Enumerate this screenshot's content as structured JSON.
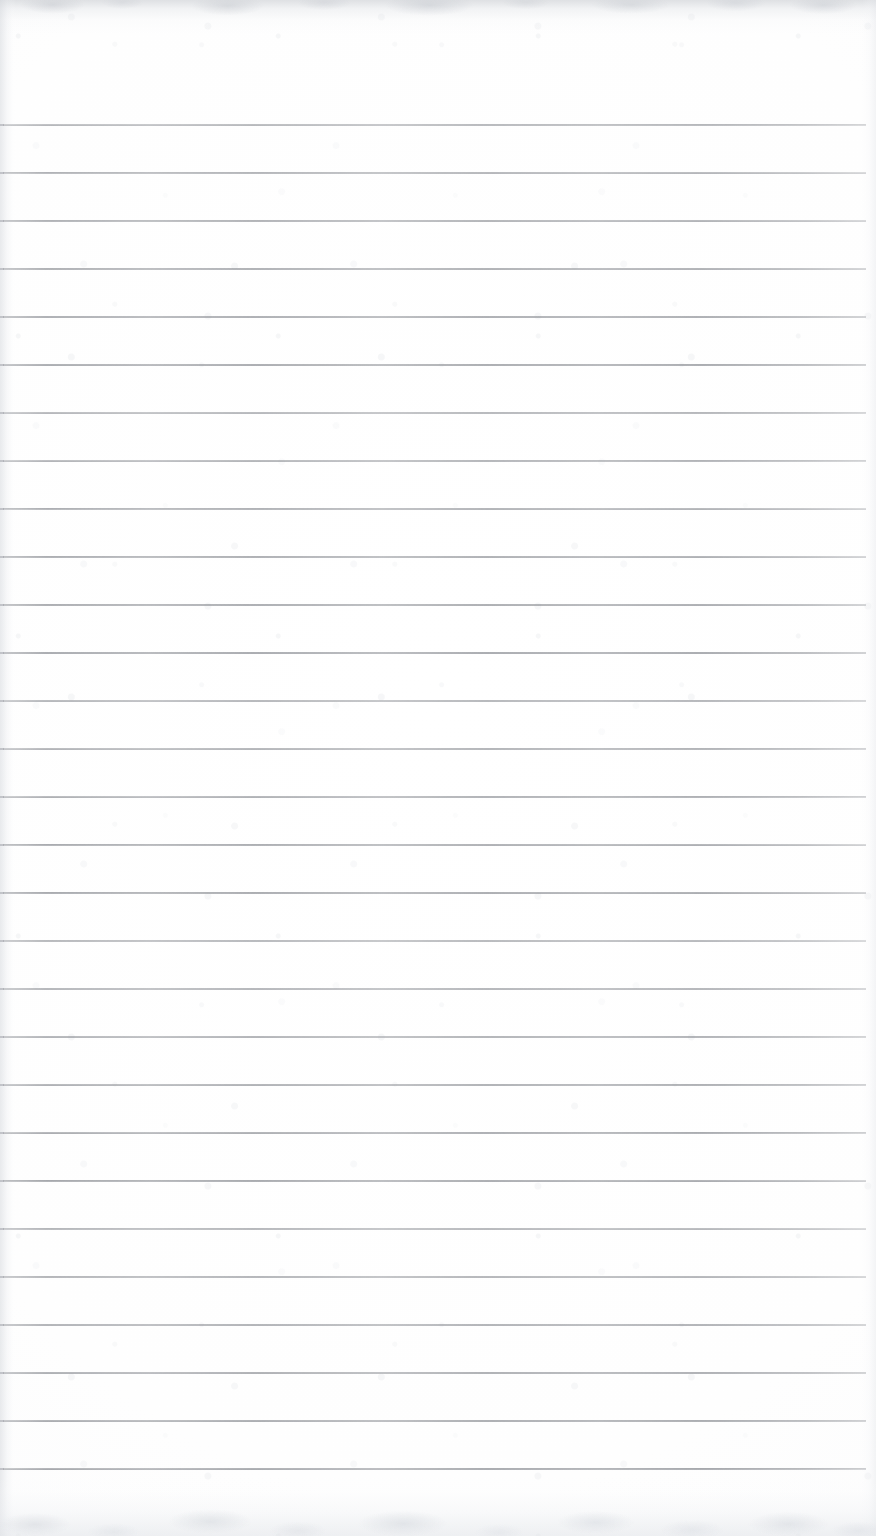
{
  "document": {
    "kind": "scanned-paper",
    "title": "Blank ruled notepad page",
    "content_text": "",
    "background_color": "#ffffff",
    "rule_color": "#7e8187",
    "edge_shadow_color": "#cbced3"
  },
  "page": {
    "width": 876,
    "height": 1536,
    "orientation": "portrait"
  },
  "ruling": {
    "line_count": 29,
    "first_line_y": 124,
    "line_spacing": 48,
    "line_thickness": 2,
    "line_start_x": 3,
    "line_end_x": 866,
    "style": "wide-ruled",
    "margin_rule": "none",
    "header_space_px": 124,
    "footer_space_px": 68
  },
  "rows": [
    {
      "index": 1,
      "y": 124,
      "text": ""
    },
    {
      "index": 2,
      "y": 172,
      "text": ""
    },
    {
      "index": 3,
      "y": 220,
      "text": ""
    },
    {
      "index": 4,
      "y": 268,
      "text": ""
    },
    {
      "index": 5,
      "y": 316,
      "text": ""
    },
    {
      "index": 6,
      "y": 364,
      "text": ""
    },
    {
      "index": 7,
      "y": 412,
      "text": ""
    },
    {
      "index": 8,
      "y": 460,
      "text": ""
    },
    {
      "index": 9,
      "y": 508,
      "text": ""
    },
    {
      "index": 10,
      "y": 556,
      "text": ""
    },
    {
      "index": 11,
      "y": 604,
      "text": ""
    },
    {
      "index": 12,
      "y": 652,
      "text": ""
    },
    {
      "index": 13,
      "y": 700,
      "text": ""
    },
    {
      "index": 14,
      "y": 748,
      "text": ""
    },
    {
      "index": 15,
      "y": 796,
      "text": ""
    },
    {
      "index": 16,
      "y": 844,
      "text": ""
    },
    {
      "index": 17,
      "y": 892,
      "text": ""
    },
    {
      "index": 18,
      "y": 940,
      "text": ""
    },
    {
      "index": 19,
      "y": 988,
      "text": ""
    },
    {
      "index": 20,
      "y": 1036,
      "text": ""
    },
    {
      "index": 21,
      "y": 1084,
      "text": ""
    },
    {
      "index": 22,
      "y": 1132,
      "text": ""
    },
    {
      "index": 23,
      "y": 1180,
      "text": ""
    },
    {
      "index": 24,
      "y": 1228,
      "text": ""
    },
    {
      "index": 25,
      "y": 1276,
      "text": ""
    },
    {
      "index": 26,
      "y": 1324,
      "text": ""
    },
    {
      "index": 27,
      "y": 1372,
      "text": ""
    },
    {
      "index": 28,
      "y": 1420,
      "text": ""
    },
    {
      "index": 29,
      "y": 1468,
      "text": ""
    }
  ]
}
